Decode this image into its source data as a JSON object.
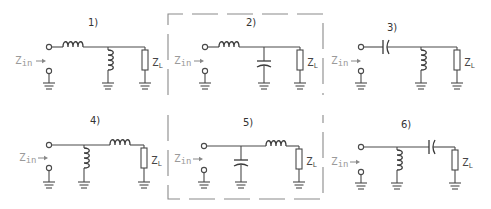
{
  "figure": {
    "highlight_box": {
      "color": "#8a8a8a",
      "style": "dashed",
      "encloses": [
        "2)",
        "5)"
      ]
    }
  },
  "circuits": [
    {
      "label": "1)",
      "series": "inductor",
      "shunt": "inductor",
      "order": "series-first",
      "zin": "Z",
      "zin_sub": "in",
      "zl": "Z",
      "zl_sub": "L"
    },
    {
      "label": "2)",
      "series": "inductor",
      "shunt": "capacitor",
      "order": "series-first",
      "zin": "Z",
      "zin_sub": "in",
      "zl": "Z",
      "zl_sub": "L"
    },
    {
      "label": "3)",
      "series": "capacitor",
      "shunt": "inductor",
      "order": "series-first",
      "zin": "Z",
      "zin_sub": "in",
      "zl": "Z",
      "zl_sub": "L"
    },
    {
      "label": "4)",
      "series": "inductor",
      "shunt": "inductor",
      "order": "shunt-first",
      "zin": "Z",
      "zin_sub": "in",
      "zl": "Z",
      "zl_sub": "L"
    },
    {
      "label": "5)",
      "series": "inductor",
      "shunt": "capacitor",
      "order": "shunt-first",
      "zin": "Z",
      "zin_sub": "in",
      "zl": "Z",
      "zl_sub": "L"
    },
    {
      "label": "6)",
      "series": "capacitor",
      "shunt": "inductor",
      "order": "shunt-first",
      "zin": "Z",
      "zin_sub": "in",
      "zl": "Z",
      "zl_sub": "L"
    }
  ]
}
